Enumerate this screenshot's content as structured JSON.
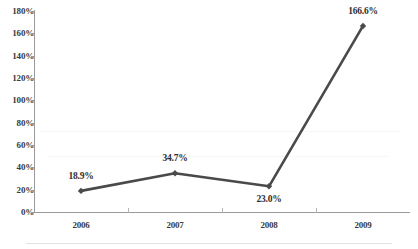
{
  "chart_data": {
    "type": "line",
    "title": "",
    "subtitle": "",
    "xlabel": "",
    "ylabel": "",
    "categories": [
      "2006",
      "2007",
      "2008",
      "2009"
    ],
    "values": [
      18.9,
      34.7,
      23.0,
      166.6
    ],
    "point_labels": [
      "18.9%",
      "34.7%",
      "23.0%",
      "166.6%"
    ],
    "series": [
      {
        "name": "",
        "values": [
          18.9,
          34.7,
          23.0,
          166.6
        ]
      }
    ],
    "ylim": [
      0,
      180
    ],
    "y_tick_values": [
      0,
      20,
      40,
      60,
      80,
      100,
      120,
      140,
      160,
      180
    ],
    "y_tick_labels": [
      "0%",
      "20%",
      "40%",
      "60%",
      "80%",
      "100%",
      "120%",
      "140%",
      "160%",
      "180%"
    ],
    "grid": false,
    "legend": false,
    "legend_position": "none",
    "marker": "diamond",
    "line_color": "#4a4a4a",
    "marker_color": "#4a4a4a",
    "axis_color": "#9a9a9a",
    "text_color": "#3b3b3b",
    "background_color": "#ffffff",
    "label_positions": [
      "above",
      "above",
      "below",
      "above"
    ]
  }
}
